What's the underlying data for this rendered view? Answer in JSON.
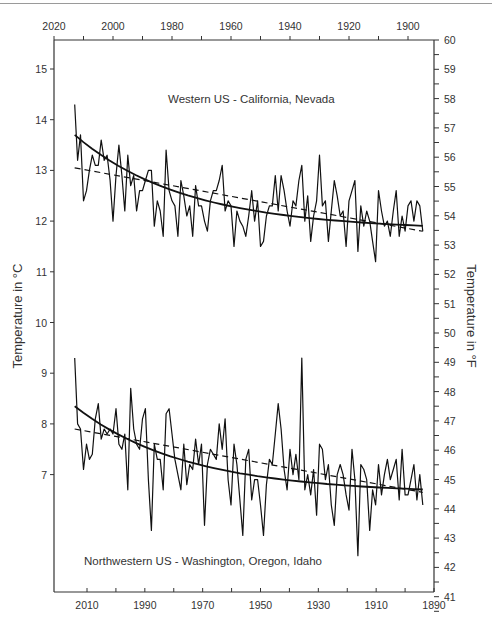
{
  "chart_data": {
    "type": "line",
    "title": "",
    "panels": [
      {
        "label": "Western US - California, Nevada",
        "series": [
          {
            "name": "Annual mean temperature",
            "style": "solid-thin"
          },
          {
            "name": "Nonlinear trend",
            "style": "solid-thick"
          },
          {
            "name": "Linear trend",
            "style": "dashed"
          }
        ]
      },
      {
        "label": "Northwestern US - Washington, Oregon, Idaho",
        "series": [
          {
            "name": "Annual mean temperature",
            "style": "solid-thin"
          },
          {
            "name": "Nonlinear trend",
            "style": "solid-thick"
          },
          {
            "name": "Linear trend",
            "style": "dashed"
          }
        ]
      }
    ],
    "x": [
      2013,
      2012,
      2011,
      2010,
      2009,
      2008,
      2007,
      2006,
      2005,
      2004,
      2003,
      2002,
      2001,
      2000,
      1999,
      1998,
      1997,
      1996,
      1995,
      1994,
      1993,
      1992,
      1991,
      1990,
      1989,
      1988,
      1987,
      1986,
      1985,
      1984,
      1983,
      1982,
      1981,
      1980,
      1979,
      1978,
      1977,
      1976,
      1975,
      1974,
      1973,
      1972,
      1971,
      1970,
      1969,
      1968,
      1967,
      1966,
      1965,
      1964,
      1963,
      1962,
      1961,
      1960,
      1959,
      1958,
      1957,
      1956,
      1955,
      1954,
      1953,
      1952,
      1951,
      1950,
      1949,
      1948,
      1947,
      1946,
      1945,
      1944,
      1943,
      1942,
      1941,
      1940,
      1939,
      1938,
      1937,
      1936,
      1935,
      1934,
      1933,
      1932,
      1931,
      1930,
      1929,
      1928,
      1927,
      1926,
      1925,
      1924,
      1923,
      1922,
      1921,
      1920,
      1919,
      1918,
      1917,
      1916,
      1915,
      1914,
      1913,
      1912,
      1911,
      1910,
      1909,
      1908,
      1907,
      1906,
      1905,
      1904,
      1903,
      1902,
      1901,
      1900,
      1899,
      1898,
      1897,
      1896,
      1895
    ],
    "series": [
      {
        "name": "Western US - California, Nevada (°C)",
        "values": [
          14.3,
          13.2,
          13.7,
          12.4,
          12.6,
          13.0,
          13.3,
          13.1,
          13.1,
          13.6,
          13.2,
          13.3,
          12.8,
          12.0,
          12.9,
          13.5,
          12.9,
          12.2,
          13.3,
          12.7,
          12.9,
          12.2,
          12.6,
          12.6,
          12.8,
          13.0,
          13.0,
          11.9,
          12.4,
          12.2,
          11.7,
          13.4,
          12.6,
          12.4,
          12.3,
          11.7,
          12.8,
          12.5,
          12.1,
          12.3,
          11.7,
          12.7,
          12.3,
          12.3,
          12.0,
          11.8,
          12.4,
          12.6,
          12.6,
          12.8,
          13.1,
          12.2,
          12.4,
          12.3,
          11.5,
          12.2,
          12.0,
          11.9,
          11.7,
          12.1,
          12.6,
          12.0,
          12.4,
          11.5,
          11.6,
          12.1,
          12.3,
          12.3,
          12.9,
          12.2,
          12.9,
          12.6,
          12.2,
          11.9,
          12.4,
          12.3,
          12.8,
          13.1,
          12.0,
          12.5,
          11.6,
          12.1,
          12.4,
          13.3,
          12.3,
          12.4,
          11.6,
          12.2,
          12.8,
          12.5,
          12.1,
          12.2,
          11.5,
          12.4,
          12.6,
          12.8,
          11.4,
          12.3,
          11.9,
          12.2,
          12.0,
          11.6,
          11.2,
          12.6,
          12.2,
          11.9,
          12.0,
          11.7,
          12.2,
          12.6,
          11.7,
          12.1,
          11.8,
          12.3,
          12.4,
          12.0,
          12.4,
          12.3,
          11.8
        ],
        "trend_nonlinear": {
          "start": 13.7,
          "end": 11.9
        },
        "trend_linear": {
          "start": 13.05,
          "end": 11.8
        }
      },
      {
        "name": "Northwestern US - Washington, Oregon, Idaho (°C)",
        "values": [
          9.3,
          8.0,
          7.9,
          7.1,
          7.6,
          7.3,
          7.4,
          8.1,
          8.4,
          7.7,
          7.9,
          7.8,
          7.9,
          7.8,
          8.3,
          7.6,
          7.5,
          7.8,
          6.7,
          8.7,
          7.9,
          7.6,
          7.5,
          8.1,
          8.3,
          6.9,
          5.9,
          7.6,
          7.3,
          7.3,
          6.7,
          8.2,
          8.3,
          7.8,
          7.3,
          7.0,
          6.7,
          7.6,
          6.8,
          7.2,
          7.1,
          7.7,
          7.2,
          7.6,
          6.0,
          7.2,
          7.5,
          7.4,
          7.3,
          8.0,
          7.5,
          8.1,
          6.9,
          6.4,
          7.6,
          7.2,
          6.5,
          5.8,
          7.3,
          7.5,
          6.5,
          6.9,
          6.9,
          6.4,
          5.8,
          6.8,
          7.3,
          7.2,
          7.8,
          8.4,
          7.9,
          7.1,
          6.7,
          7.5,
          7.0,
          7.4,
          6.9,
          9.3,
          6.7,
          7.0,
          6.6,
          7.1,
          6.2,
          7.6,
          7.5,
          6.9,
          7.2,
          6.4,
          6.0,
          7.0,
          7.2,
          7.0,
          6.6,
          6.3,
          7.5,
          6.9,
          5.4,
          7.2,
          7.1,
          6.9,
          5.9,
          6.7,
          6.4,
          7.2,
          6.6,
          7.0,
          7.3,
          6.9,
          7.1,
          7.3,
          6.5,
          7.5,
          6.6,
          6.6,
          6.9,
          7.2,
          6.5,
          7.0,
          6.4
        ],
        "trend_nonlinear": {
          "start": 8.35,
          "end": 6.7
        },
        "trend_linear": {
          "start": 7.9,
          "end": 6.65
        }
      }
    ],
    "top_axis": {
      "ticks": [
        2020,
        2000,
        1980,
        1960,
        1940,
        1920,
        1900
      ]
    },
    "bottom_axis": {
      "ticks": [
        2010,
        1990,
        1970,
        1950,
        1930,
        1910,
        1890
      ]
    },
    "xlim": [
      2020,
      1890
    ],
    "left_axis": {
      "label": "Temperature in °C",
      "ticks": [
        15,
        14,
        13,
        12,
        11,
        10,
        9,
        8,
        7
      ]
    },
    "right_axis": {
      "label": "Temperature in °F",
      "ticks": [
        60,
        59,
        58,
        57,
        56,
        55,
        54,
        53,
        52,
        51,
        50,
        49,
        48,
        47,
        46,
        45,
        44,
        43,
        42,
        41
      ]
    },
    "xlabel": "",
    "ylabel": "Temperature in °C",
    "ylabel_right": "Temperature in °F",
    "grid": false,
    "legend": "none",
    "line_color": "#111111"
  }
}
